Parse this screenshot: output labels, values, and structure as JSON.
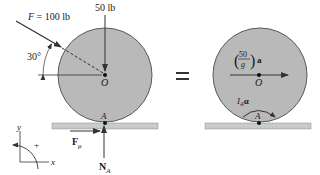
{
  "figure": {
    "colors": {
      "disk_fill": "#b9b9b9",
      "disk_stroke": "#5a5a5a",
      "ground_fill": "#c9cccc",
      "ink": "#333333",
      "background": "#ffffff"
    },
    "free_body_diagram": {
      "applied_force": {
        "symbol": "F",
        "equals": " = 100 lb"
      },
      "angle_label": "30°",
      "weight_label": "50 lb",
      "center_label": "O",
      "contact_label": "A",
      "friction_label": {
        "symbol": "F",
        "subscript": "μ"
      },
      "normal_label": {
        "symbol": "N",
        "subscript": "A"
      }
    },
    "equals_sign": "=",
    "kinetic_diagram": {
      "mass_term": {
        "numerator": "50",
        "denominator": "g",
        "vector": "a"
      },
      "center_label": "O",
      "contact_label": "A",
      "moment_term": {
        "symbol": "I",
        "subscript": "A",
        "vector": "α"
      }
    },
    "axes": {
      "x_label": "x",
      "y_label": "y",
      "sign_label": "+"
    }
  }
}
